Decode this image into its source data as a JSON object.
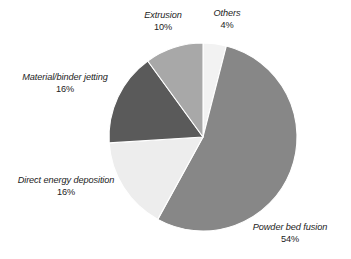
{
  "chart_data": {
    "type": "pie",
    "title": "",
    "subtitle": "",
    "xlabel": "",
    "ylabel": "",
    "legend_position": "none",
    "grid": false,
    "units": "percent",
    "start_angle_deg": 0,
    "direction": "clockwise",
    "categories": [
      "Others",
      "Powder bed fusion",
      "Direct energy deposition",
      "Material/binder jetting",
      "Extrusion"
    ],
    "values": [
      4,
      54,
      16,
      16,
      10
    ],
    "slices": [
      {
        "label": "Others",
        "value": 4,
        "value_text": "4%",
        "color": "#f2f2f2",
        "start_deg": 0,
        "end_deg": 14.4
      },
      {
        "label": "Powder bed fusion",
        "value": 54,
        "value_text": "54%",
        "color": "#878787",
        "start_deg": 14.4,
        "end_deg": 208.8
      },
      {
        "label": "Direct energy deposition",
        "value": 16,
        "value_text": "16%",
        "color": "#ededed",
        "start_deg": 208.8,
        "end_deg": 266.4
      },
      {
        "label": "Material/binder jetting",
        "value": 16,
        "value_text": "16%",
        "color": "#5a5a5a",
        "start_deg": 266.4,
        "end_deg": 324.0
      },
      {
        "label": "Extrusion",
        "value": 10,
        "value_text": "10%",
        "color": "#a8a8a8",
        "start_deg": 324.0,
        "end_deg": 360.0
      }
    ]
  },
  "labels": {
    "extrusion": {
      "name": "Extrusion",
      "value": "10%"
    },
    "others": {
      "name": "Others",
      "value": "4%"
    },
    "material_binder_jetting": {
      "name": "Material/binder jetting",
      "value": "16%"
    },
    "direct_energy_deposition": {
      "name": "Direct energy deposition",
      "value": "16%"
    },
    "powder_bed_fusion": {
      "name": "Powder bed fusion",
      "value": "54%"
    }
  },
  "colors": {
    "background": "#ffffff",
    "text": "#1c1c1c",
    "slice_outline": "#ffffff",
    "others": "#f2f2f2",
    "powder_bed_fusion": "#878787",
    "direct_energy_deposition": "#ededed",
    "material_binder_jetting": "#5a5a5a",
    "extrusion": "#a8a8a8"
  }
}
